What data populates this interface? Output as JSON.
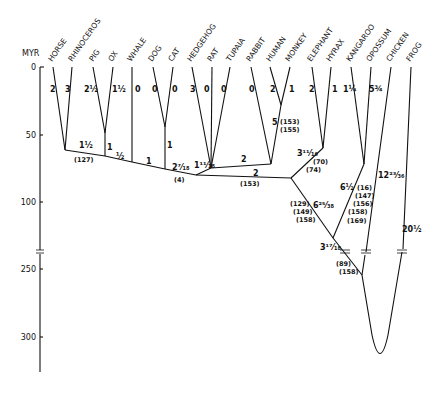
{
  "axis": {
    "label": "MYR",
    "ticks": [
      {
        "label": "0",
        "y": 67
      },
      {
        "label": "50",
        "y": 135
      },
      {
        "label": "100",
        "y": 202
      },
      {
        "label": "250",
        "y": 269
      },
      {
        "label": "300",
        "y": 337
      }
    ]
  },
  "taxa": [
    {
      "name": "HORSE",
      "x": 53,
      "branch": "2"
    },
    {
      "name": "RHINOCEROS",
      "x": 72,
      "branch": "3"
    },
    {
      "name": "PIG",
      "x": 93,
      "branch": "2½"
    },
    {
      "name": "OX",
      "x": 113,
      "branch": "1½"
    },
    {
      "name": "WHALE",
      "x": 132,
      "branch": "0"
    },
    {
      "name": "DOG",
      "x": 153,
      "branch": "0"
    },
    {
      "name": "CAT",
      "x": 173,
      "branch": "0"
    },
    {
      "name": "HEDGEHOG",
      "x": 192,
      "branch": "3"
    },
    {
      "name": "RAT",
      "x": 212,
      "branch": "0"
    },
    {
      "name": "TUPAIA",
      "x": 230,
      "branch": "0"
    },
    {
      "name": "RABBIT",
      "x": 251,
      "branch": "0"
    },
    {
      "name": "HUMAN",
      "x": 270,
      "branch": "2"
    },
    {
      "name": "MONKEY",
      "x": 290,
      "branch": "1"
    },
    {
      "name": "ELEPHANT",
      "x": 312,
      "branch": "2"
    },
    {
      "name": "HYRAX",
      "x": 331,
      "branch": "1"
    },
    {
      "name": "KANGAROO",
      "x": 351,
      "branch": "1¼"
    },
    {
      "name": "OPOSSUM",
      "x": 371,
      "branch": "5¾"
    },
    {
      "name": "CHICKEN",
      "x": 391,
      "branch": ""
    },
    {
      "name": "FROG",
      "x": 411,
      "branch": ""
    }
  ],
  "internal_labels": {
    "horse_rhino_stem": "1½",
    "horse_rhino_ref": "(127)",
    "pig_ox_stem": "1",
    "ungulate_seg1": "½",
    "ungulate_seg2": "1",
    "dog_cat_stem": "1",
    "carnivore_seg": "2⁷⁄₁₈",
    "carnivore_ref": "(4)",
    "hedgehog_node": "1¹¹⁄₁₈",
    "primate_seg": "2",
    "human_monkey_stem": "5",
    "human_monkey_ref1": "(153)",
    "human_monkey_ref2": "(155)",
    "eutherian_seg": "2",
    "eutherian_ref": "(153)",
    "paenungulate_stem": "3¹¹⁄₁₆",
    "paenungulate_ref1": "(70)",
    "paenungulate_ref2": "(74)",
    "eutherian_stem": "6²⁵⁄₃₈",
    "eutherian_stem_ref1": "(129)",
    "eutherian_stem_ref2": "(149)",
    "eutherian_stem_ref3": "(158)",
    "marsupial_stem": "6½",
    "marsupial_ref1": "(16)",
    "marsupial_ref2": "(147)",
    "marsupial_ref3": "(156)",
    "marsupial_ref4": "(158)",
    "marsupial_ref5": "(169)",
    "mammal_node": "3¹⁷⁄₁₈",
    "mammal_ref1": "(89)",
    "mammal_ref2": "(158)",
    "chicken_branch": "12²³⁄₃₆",
    "frog_branch": "20½"
  }
}
